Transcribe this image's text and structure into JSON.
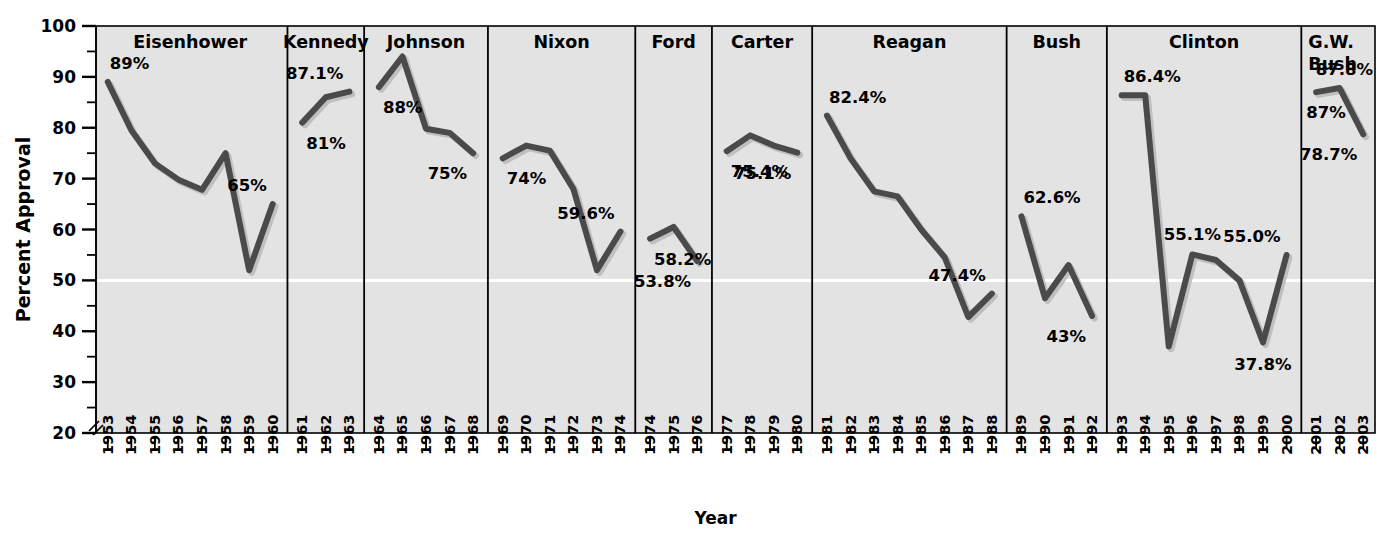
{
  "chart_data": {
    "type": "line",
    "title": "",
    "xlabel": "Year",
    "ylabel": "Percent Approval",
    "ylim": [
      20,
      100
    ],
    "ytick_labels": [
      "100",
      "90",
      "80",
      "70",
      "60",
      "50",
      "40",
      "30",
      "20"
    ],
    "ytick_values": [
      100,
      90,
      80,
      70,
      60,
      50,
      40,
      30,
      20
    ],
    "minor_tick_step": 5,
    "axis_break": true,
    "grid": false,
    "highlight_line": 50,
    "legend": "none",
    "panels": [
      {
        "name": "Eisenhower",
        "years": [
          "1953",
          "1954",
          "1955",
          "1956",
          "1957",
          "1958",
          "1959",
          "1960"
        ],
        "values": [
          89,
          79.5,
          73,
          69.8,
          67.8,
          75,
          52,
          65
        ],
        "labels": [
          {
            "text": "89%",
            "year": "1953",
            "value": 89,
            "pos": "above-right"
          },
          {
            "text": "65%",
            "year": "1960",
            "value": 65,
            "pos": "above-left"
          }
        ]
      },
      {
        "name": "Kennedy",
        "years": [
          "1961",
          "1962",
          "1963"
        ],
        "values": [
          81,
          86,
          87.1
        ],
        "labels": [
          {
            "text": "87.1%",
            "year": "1963",
            "value": 87.1,
            "pos": "above-left"
          },
          {
            "text": "81%",
            "year": "1961",
            "value": 81,
            "pos": "below-right"
          }
        ]
      },
      {
        "name": "Johnson",
        "years": [
          "1964",
          "1965",
          "1966",
          "1967",
          "1968"
        ],
        "values": [
          88,
          94,
          79.8,
          79,
          75
        ],
        "labels": [
          {
            "text": "88%",
            "year": "1964",
            "value": 88,
            "pos": "below-right"
          },
          {
            "text": "75%",
            "year": "1968",
            "value": 75,
            "pos": "below-left"
          }
        ]
      },
      {
        "name": "Nixon",
        "years": [
          "1969",
          "1970",
          "1971",
          "1972",
          "1973",
          "1974"
        ],
        "values": [
          74,
          76.5,
          75.5,
          68,
          52,
          59.6
        ],
        "labels": [
          {
            "text": "74%",
            "year": "1969",
            "value": 74,
            "pos": "below-right"
          },
          {
            "text": "59.6%",
            "year": "1974",
            "value": 59.6,
            "pos": "above-left"
          }
        ]
      },
      {
        "name": "Ford",
        "years": [
          "1974",
          "1975",
          "1976"
        ],
        "values": [
          58.2,
          60.5,
          53.8
        ],
        "labels": [
          {
            "text": "58.2%",
            "year": "1974",
            "value": 58.2,
            "pos": "below-right"
          },
          {
            "text": "53.8%",
            "year": "1976",
            "value": 53.8,
            "pos": "below-left"
          }
        ]
      },
      {
        "name": "Carter",
        "years": [
          "1977",
          "1978",
          "1979",
          "1980"
        ],
        "values": [
          75.4,
          78.5,
          76.5,
          75.1
        ],
        "labels": [
          {
            "text": "75.4%",
            "year": "1977",
            "value": 75.4,
            "pos": "below-right"
          },
          {
            "text": "75.1%",
            "year": "1980",
            "value": 75.1,
            "pos": "below-left"
          }
        ]
      },
      {
        "name": "Reagan",
        "years": [
          "1981",
          "1982",
          "1983",
          "1984",
          "1985",
          "1986",
          "1987",
          "1988"
        ],
        "values": [
          82.4,
          74,
          67.5,
          66.5,
          60,
          54.5,
          42.8,
          47.4
        ],
        "labels": [
          {
            "text": "82.4%",
            "year": "1981",
            "value": 82.4,
            "pos": "above-right"
          },
          {
            "text": "47.4%",
            "year": "1988",
            "value": 47.4,
            "pos": "above-left"
          }
        ]
      },
      {
        "name": "Bush",
        "years": [
          "1989",
          "1990",
          "1991",
          "1992"
        ],
        "values": [
          62.6,
          46.5,
          53,
          43
        ],
        "labels": [
          {
            "text": "62.6%",
            "year": "1989",
            "value": 62.6,
            "pos": "above-right"
          },
          {
            "text": "43%",
            "year": "1992",
            "value": 43,
            "pos": "below-left"
          }
        ]
      },
      {
        "name": "Clinton",
        "years": [
          "1993",
          "1994",
          "1995",
          "1996",
          "1997",
          "1998",
          "1999",
          "2000"
        ],
        "values": [
          86.4,
          86.4,
          37,
          55.1,
          54,
          50,
          37.8,
          55.0
        ],
        "labels": [
          {
            "text": "86.4%",
            "year": "1993",
            "value": 86.4,
            "pos": "above-right"
          },
          {
            "text": "55.1%",
            "year": "1996",
            "value": 55.1,
            "pos": "above-center"
          },
          {
            "text": "55.0%",
            "year": "2000",
            "value": 55.0,
            "pos": "above-left"
          },
          {
            "text": "37.8%",
            "year": "1999",
            "value": 37.8,
            "pos": "below-center"
          }
        ]
      },
      {
        "name": "G.W. Bush",
        "name_lines": [
          "G.W.",
          "Bush"
        ],
        "years": [
          "2001",
          "2002",
          "2003"
        ],
        "values": [
          87,
          87.8,
          78.7
        ],
        "labels": [
          {
            "text": "87.8%",
            "year": "2002",
            "value": 87.8,
            "pos": "above-right"
          },
          {
            "text": "87%",
            "year": "2001",
            "value": 87,
            "pos": "below-left"
          },
          {
            "text": "78.7%",
            "year": "2003",
            "value": 78.7,
            "pos": "below-left"
          }
        ]
      }
    ]
  },
  "colors": {
    "plot_background": "#e3e3e3",
    "line_color": "#4a4a4a",
    "axis_color": "#000000",
    "text_color": "#000000",
    "highlight_line_color": "#ffffff",
    "page_background": "#ffffff"
  }
}
